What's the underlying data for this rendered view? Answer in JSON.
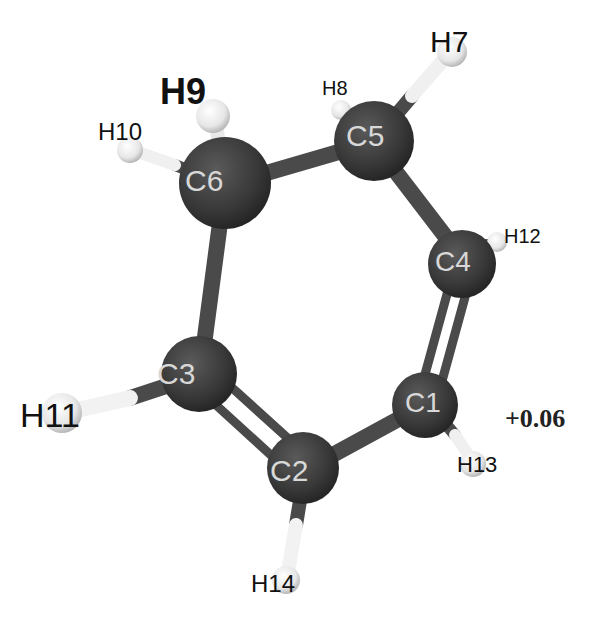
{
  "diagram": {
    "type": "ball-and-stick molecule",
    "charge_label": "+0.06",
    "atoms": [
      {
        "id": "C1",
        "label": "C1",
        "element": "C"
      },
      {
        "id": "C2",
        "label": "C2",
        "element": "C"
      },
      {
        "id": "C3",
        "label": "C3",
        "element": "C"
      },
      {
        "id": "C4",
        "label": "C4",
        "element": "C"
      },
      {
        "id": "C5",
        "label": "C5",
        "element": "C"
      },
      {
        "id": "C6",
        "label": "C6",
        "element": "C"
      },
      {
        "id": "H7",
        "label": "H7",
        "element": "H"
      },
      {
        "id": "H8",
        "label": "H8",
        "element": "H"
      },
      {
        "id": "H9",
        "label": "H9",
        "element": "H"
      },
      {
        "id": "H10",
        "label": "H10",
        "element": "H"
      },
      {
        "id": "H11",
        "label": "H11",
        "element": "H"
      },
      {
        "id": "H12",
        "label": "H12",
        "element": "H"
      },
      {
        "id": "H13",
        "label": "H13",
        "element": "H"
      },
      {
        "id": "H14",
        "label": "H14",
        "element": "H"
      }
    ],
    "bonds": [
      {
        "from": "C1",
        "to": "C2",
        "order": 1
      },
      {
        "from": "C2",
        "to": "C3",
        "order": 2
      },
      {
        "from": "C3",
        "to": "C6",
        "order": 1
      },
      {
        "from": "C6",
        "to": "C5",
        "order": 1
      },
      {
        "from": "C5",
        "to": "C4",
        "order": 1
      },
      {
        "from": "C4",
        "to": "C1",
        "order": 2
      },
      {
        "from": "C5",
        "to": "H7",
        "order": 1
      },
      {
        "from": "C5",
        "to": "H8",
        "order": 1
      },
      {
        "from": "C6",
        "to": "H9",
        "order": 1
      },
      {
        "from": "C6",
        "to": "H10",
        "order": 1
      },
      {
        "from": "C3",
        "to": "H11",
        "order": 1
      },
      {
        "from": "C4",
        "to": "H12",
        "order": 1
      },
      {
        "from": "C1",
        "to": "H13",
        "order": 1
      },
      {
        "from": "C2",
        "to": "H14",
        "order": 1
      }
    ],
    "colors": {
      "carbon": "#3a3a3a",
      "hydrogen": "#eeeeee",
      "bond": "#4a4a4a",
      "background": "#ffffff"
    }
  }
}
